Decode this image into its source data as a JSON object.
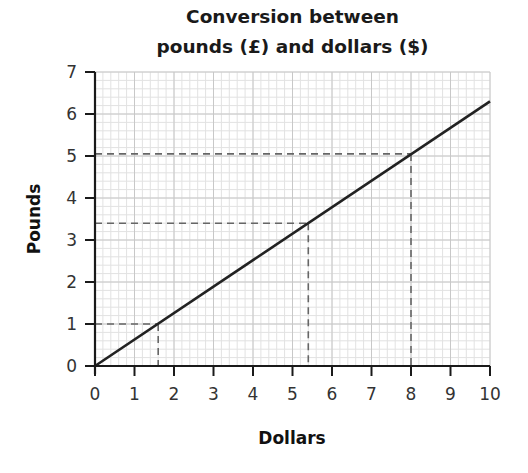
{
  "chart_data": {
    "type": "line",
    "title": "Conversion between pounds (£) and dollars ($)",
    "title_lines": [
      "Conversion between",
      "pounds (£) and dollars ($)"
    ],
    "xlabel": "Dollars",
    "ylabel": "Pounds",
    "xlim": [
      0,
      10
    ],
    "ylim": [
      0,
      7
    ],
    "x_ticks": [
      0,
      1,
      2,
      3,
      4,
      5,
      6,
      7,
      8,
      9,
      10
    ],
    "y_ticks": [
      0,
      1,
      2,
      3,
      4,
      5,
      6,
      7
    ],
    "grid": true,
    "grid_minor_divisions": 5,
    "legend": null,
    "series": [
      {
        "name": "Conversion line",
        "x": [
          0,
          10
        ],
        "y": [
          0,
          6.3
        ],
        "color": "#222222"
      }
    ],
    "annotations": [
      {
        "type": "dashed-guide",
        "x": 1.6,
        "y": 1.0,
        "label": "$1.60 = £1"
      },
      {
        "type": "dashed-guide",
        "x": 5.4,
        "y": 3.4,
        "label": "$5.40 = £3.40"
      },
      {
        "type": "dashed-guide",
        "x": 8.0,
        "y": 5.05,
        "label": "$8 = £5"
      }
    ]
  },
  "colors": {
    "axis": "#1a1a1a",
    "grid_major": "#c8c8c8",
    "grid_minor": "#e2e2e2",
    "line": "#222222",
    "dashed": "#666666"
  }
}
